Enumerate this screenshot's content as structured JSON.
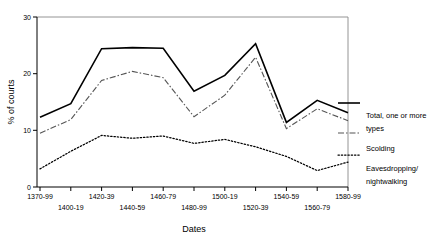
{
  "chart_data": {
    "type": "line",
    "title": "",
    "xlabel": "Dates",
    "ylabel": "% of courts",
    "ylim": [
      0,
      30
    ],
    "yticks": [
      0,
      10,
      20,
      30
    ],
    "grid": false,
    "legend_position": "right",
    "categories": [
      "1370-99",
      "1400-19",
      "1420-39",
      "1440-59",
      "1460-79",
      "1480-99",
      "1500-19",
      "1520-39",
      "1540-59",
      "1560-79",
      "1580-99"
    ],
    "series": [
      {
        "name": "Total, one or more types",
        "style": "solid",
        "values": [
          12.3,
          14.7,
          24.4,
          24.6,
          24.5,
          16.9,
          19.7,
          25.3,
          11.4,
          15.3,
          13.1
        ]
      },
      {
        "name": "Scolding",
        "style": "dash-dot",
        "values": [
          9.5,
          11.9,
          18.8,
          20.4,
          19.3,
          12.4,
          16.2,
          22.9,
          10.3,
          13.8,
          11.7
        ]
      },
      {
        "name": "Eavesdropping/nightwalking",
        "style": "dotted",
        "values": [
          3.2,
          6.3,
          9.1,
          8.6,
          9.0,
          7.7,
          8.4,
          7.1,
          5.4,
          2.9,
          4.4
        ]
      }
    ]
  },
  "axis": {
    "ylabel": "% of courts",
    "xlabel": "Dates",
    "ytick_labels": [
      "0",
      "10",
      "20",
      "30"
    ],
    "xtick_labels_row1": [
      "1370-99",
      "1420-39",
      "1460-79",
      "1500-19",
      "1540-59",
      "1580-99"
    ],
    "xtick_labels_row2": [
      "1400-19",
      "1440-59",
      "1480-99",
      "1520-39",
      "1560-79"
    ]
  },
  "legend": {
    "items": [
      {
        "label_line1": "Total, one or more",
        "label_line2": "types",
        "style": "solid"
      },
      {
        "label_line1": "Scolding",
        "label_line2": "",
        "style": "dash-dot"
      },
      {
        "label_line1": "Eavesdropping/",
        "label_line2": "nightwalking",
        "style": "dotted"
      }
    ]
  },
  "colors": {
    "total": "#000000",
    "scolding": "#555555",
    "eavesdropping": "#000000",
    "frame": "#888888"
  }
}
